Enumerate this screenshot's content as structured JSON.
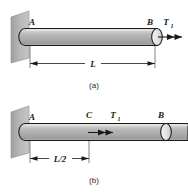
{
  "figure": {
    "panels": [
      {
        "id": "a",
        "caption": "(a)",
        "labels": {
          "fixed_end": "A",
          "free_end": "B",
          "torque": "T",
          "torque_sub": "1",
          "dimension": "L"
        }
      },
      {
        "id": "b",
        "caption": "(b)",
        "labels": {
          "fixed_end": "A",
          "section_point": "C",
          "free_end": "B",
          "torque": "T",
          "torque_sub": "1",
          "dimension": "L/2"
        }
      }
    ],
    "colors": {
      "shaft_body": "#b3b3b3",
      "shaft_highlight": "#d8d8d8",
      "wall_face": "#b0b0b0",
      "wall_edge": "#8f8f8f",
      "outline": "#1a1a1a",
      "background": "#ffffff"
    }
  }
}
